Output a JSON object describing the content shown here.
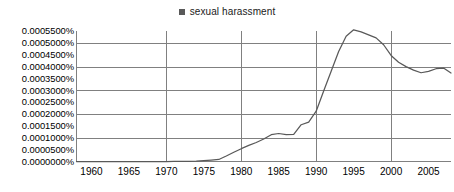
{
  "legend": {
    "entries": [
      {
        "label": "sexual harassment",
        "color": "#595959",
        "marker": "square-marker"
      }
    ]
  },
  "axes": {
    "y_tick_labels": [
      "0.0005500%",
      "0.0005000%",
      "0.0004500%",
      "0.0004000%",
      "0.0003500%",
      "0.0003000%",
      "0.0002500%",
      "0.0002000%",
      "0.0001500%",
      "0.0001000%",
      "0.0000500%",
      "0.0000000%"
    ],
    "x_tick_labels": [
      "1960",
      "1965",
      "1970",
      "1975",
      "1980",
      "1985",
      "1990",
      "1995",
      "2000",
      "2005"
    ]
  },
  "chart_data": {
    "type": "line",
    "title": "",
    "subtitle": "",
    "xlabel": "",
    "ylabel": "",
    "xlim": [
      1958,
      2008
    ],
    "ylim": [
      0.0,
      0.00055
    ],
    "grid": true,
    "grid_x_values": [
      1970,
      1980,
      1990,
      2000
    ],
    "grid_y_values": [
      0.0001,
      0.0002,
      0.0003,
      0.0004,
      0.0005
    ],
    "y_tick_values": [
      0.0,
      5e-05,
      0.0001,
      0.00015,
      0.0002,
      0.00025,
      0.0003,
      0.00035,
      0.0004,
      0.00045,
      0.0005,
      0.00055
    ],
    "x_tick_values": [
      1960,
      1965,
      1970,
      1975,
      1980,
      1985,
      1990,
      1995,
      2000,
      2005
    ],
    "y_unit": "percent",
    "legend_position": "top-center",
    "series": [
      {
        "name": "sexual harassment",
        "color": "#595959",
        "x": [
          1958,
          1960,
          1962,
          1964,
          1966,
          1968,
          1970,
          1971,
          1972,
          1973,
          1974,
          1975,
          1976,
          1977,
          1978,
          1979,
          1980,
          1981,
          1982,
          1983,
          1984,
          1985,
          1986,
          1987,
          1988,
          1989,
          1990,
          1991,
          1992,
          1993,
          1994,
          1995,
          1996,
          1997,
          1998,
          1999,
          2000,
          2001,
          2002,
          2003,
          2004,
          2005,
          2006,
          2007,
          2008
        ],
        "values": [
          0.0,
          0.0,
          0.0,
          0.0,
          0.0,
          0.0,
          0.0,
          2e-07,
          4e-07,
          8e-07,
          2e-06,
          4e-06,
          6e-06,
          8.5e-06,
          2.3e-05,
          3.9e-05,
          5.4e-05,
          6.8e-05,
          8e-05,
          9.5e-05,
          0.000113,
          0.000118,
          0.000113,
          0.000114,
          0.000155,
          0.000166,
          0.000212,
          0.000297,
          0.00038,
          0.000464,
          0.000528,
          0.000555,
          0.000546,
          0.000534,
          0.000521,
          0.000492,
          0.000447,
          0.000418,
          0.0004,
          0.000385,
          0.000374,
          0.00038,
          0.000391,
          0.000394,
          0.000373
        ]
      }
    ]
  },
  "colors": {
    "series": "#595959",
    "grid_major": "#808080",
    "grid_minor": "#b3b3b3",
    "axis": "#808080",
    "background": "#ffffff",
    "text": "#000000"
  }
}
